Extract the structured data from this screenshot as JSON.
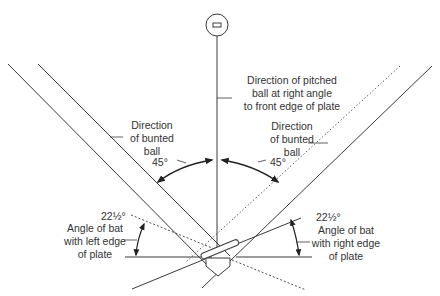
{
  "diagram": {
    "colors": {
      "line": "#3a3a3a",
      "text": "#333333",
      "background": "#ffffff"
    },
    "labels": {
      "pitched": {
        "line1": "Direction of pitched",
        "line2": "ball at right angle",
        "line3": "to front edge of plate"
      },
      "bunt_left": {
        "line1": "Direction",
        "line2": "of bunted",
        "line3": "ball",
        "angle": "45°"
      },
      "bunt_right": {
        "line1": "Direction",
        "line2": "of bunted",
        "line3": "ball",
        "angle": "45°"
      },
      "bat_left": {
        "angle": "22½°",
        "line1": "Angle of bat",
        "line2": "with left edge",
        "line3": "of plate"
      },
      "bat_right": {
        "angle": "22½°",
        "line1": "Angle of bat",
        "line2": "with right edge",
        "line3": "of plate"
      }
    },
    "elements": [
      "ball-circle",
      "pitch-direction-line",
      "left-foul-line-double",
      "right-foul-line",
      "right-bunt-dotted-line",
      "left-bat-dashed-line",
      "home-plate",
      "bat",
      "left-edge-reference-line",
      "right-edge-reference-line",
      "left-45-arc-arrow",
      "right-45-arc-arrow",
      "left-22.5-arc-arrow",
      "right-22.5-arc-arrow"
    ]
  }
}
